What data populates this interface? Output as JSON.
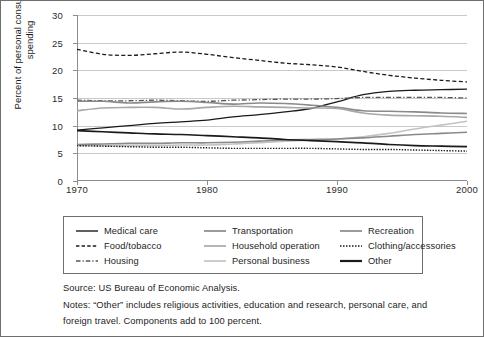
{
  "chart_data": {
    "type": "line",
    "title": "",
    "xlabel": "",
    "ylabel": "Percent of personal consumption spending",
    "xlim": [
      1970,
      2000
    ],
    "ylim": [
      0,
      30
    ],
    "xticks": [
      "1970",
      "1980",
      "1990",
      "2000"
    ],
    "yticks": [
      "0",
      "5",
      "10",
      "15",
      "20",
      "25",
      "30"
    ],
    "grid": "horizontal",
    "legend_position": "below-axes",
    "x": [
      1970,
      1972,
      1974,
      1976,
      1978,
      1980,
      1982,
      1984,
      1986,
      1988,
      1990,
      1992,
      1994,
      1996,
      1998,
      2000
    ],
    "series": [
      {
        "name": "Medical care",
        "style": "solid",
        "color": "#1a1a1a",
        "width": 1.3,
        "values": [
          9.2,
          9.6,
          10.0,
          10.4,
          10.7,
          11.0,
          11.6,
          12.0,
          12.5,
          13.1,
          14.3,
          15.6,
          16.2,
          16.4,
          16.5,
          16.6
        ]
      },
      {
        "name": "Food/tobacco",
        "style": "dashed",
        "color": "#1a1a1a",
        "width": 1.3,
        "values": [
          23.8,
          22.9,
          22.7,
          23.0,
          23.3,
          22.9,
          22.3,
          21.8,
          21.3,
          21.0,
          20.6,
          19.8,
          19.1,
          18.6,
          18.2,
          17.9
        ]
      },
      {
        "name": "Housing",
        "style": "dashdot",
        "color": "#555555",
        "width": 1.3,
        "values": [
          14.6,
          14.5,
          14.5,
          14.6,
          14.5,
          14.4,
          14.6,
          14.7,
          14.8,
          14.8,
          14.9,
          15.1,
          15.1,
          15.1,
          15.1,
          15.0
        ]
      },
      {
        "name": "Transportation",
        "style": "solid",
        "color": "#8a8a8a",
        "width": 1.6,
        "values": [
          14.4,
          14.4,
          14.1,
          14.3,
          14.4,
          14.2,
          13.9,
          14.1,
          14.0,
          13.7,
          13.3,
          12.7,
          12.6,
          12.5,
          12.3,
          12.2
        ]
      },
      {
        "name": "Household operation",
        "style": "solid",
        "color": "#a8a8a8",
        "width": 1.6,
        "values": [
          12.7,
          13.2,
          13.3,
          13.3,
          13.0,
          13.3,
          13.5,
          13.4,
          13.3,
          13.2,
          13.1,
          12.3,
          11.9,
          11.8,
          11.7,
          11.5
        ]
      },
      {
        "name": "Personal business",
        "style": "solid",
        "color": "#c3c3c3",
        "width": 1.6,
        "values": [
          6.4,
          6.4,
          6.4,
          6.4,
          6.5,
          6.5,
          6.7,
          6.9,
          7.2,
          7.4,
          7.6,
          8.0,
          8.6,
          9.4,
          10.1,
          10.8
        ]
      },
      {
        "name": "Recreation",
        "style": "solid",
        "color": "#8a8a8a",
        "width": 1.6,
        "values": [
          6.6,
          6.7,
          6.8,
          6.8,
          6.9,
          6.9,
          7.0,
          7.2,
          7.4,
          7.5,
          7.6,
          7.8,
          8.1,
          8.4,
          8.6,
          8.8
        ]
      },
      {
        "name": "Clothing/accessories",
        "style": "dotted",
        "color": "#1a1a1a",
        "width": 1.4,
        "values": [
          6.4,
          6.3,
          6.2,
          6.1,
          6.1,
          6.0,
          5.9,
          5.9,
          5.9,
          5.9,
          5.8,
          5.7,
          5.7,
          5.6,
          5.5,
          5.4
        ]
      },
      {
        "name": "Other",
        "style": "solid",
        "color": "#1a1a1a",
        "width": 1.7,
        "values": [
          9.1,
          8.9,
          8.7,
          8.5,
          8.4,
          8.2,
          8.0,
          7.8,
          7.5,
          7.3,
          7.1,
          6.9,
          6.6,
          6.4,
          6.3,
          6.2
        ]
      }
    ]
  },
  "axes": {
    "y_title": "Percent of personal consumption spending"
  },
  "legend": {
    "items": [
      {
        "label": "Medical care",
        "swatch": "solid-black-thin"
      },
      {
        "label": "Transportation",
        "swatch": "solid-gray-mid"
      },
      {
        "label": "Recreation",
        "swatch": "solid-gray-mid"
      },
      {
        "label": "Food/tobacco",
        "swatch": "dashed-black"
      },
      {
        "label": "Household operation",
        "swatch": "solid-gray-light"
      },
      {
        "label": "Clothing/accessories",
        "swatch": "dotted-black"
      },
      {
        "label": "Housing",
        "swatch": "dashdot-gray"
      },
      {
        "label": "Personal business",
        "swatch": "solid-gray-lighter"
      },
      {
        "label": "Other",
        "swatch": "solid-black-thick"
      }
    ]
  },
  "notes": {
    "source": "Source: US Bureau of Economic Analysis.",
    "note_line_1": "Notes: “Other” includes religious activities, education and research, personal care, and",
    "note_line_2": "foreign travel. Components add to 100 percent."
  }
}
